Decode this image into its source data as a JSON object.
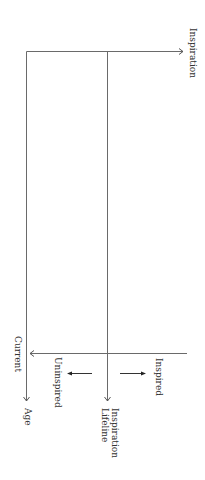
{
  "diagram": {
    "type": "inspiration-lifeline-axes",
    "orientation": "rotated-90-clockwise",
    "labels": {
      "inspiration_axis": "Inspiration",
      "current": "Current",
      "age_axis": "Age",
      "inspired": "Inspired",
      "uninspired": "Uninspired",
      "lifeline_line1": "Inspiration",
      "lifeline_line2": "Lifeline"
    },
    "colors": {
      "axis": "#6a6a6a",
      "arrow": "#555555",
      "direction_arrow": "#222222",
      "text": "#333333",
      "background": "#ffffff"
    }
  }
}
